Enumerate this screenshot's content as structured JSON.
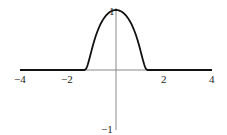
{
  "chart_data": {
    "type": "line",
    "title": "",
    "xlabel": "",
    "ylabel": "",
    "xlim": [
      -4,
      4
    ],
    "ylim": [
      -1,
      1
    ],
    "grid": false,
    "legend": null,
    "x_ticks": [
      {
        "value": -4,
        "label": "−4"
      },
      {
        "value": -2,
        "label": "−2"
      },
      {
        "value": 2,
        "label": "2"
      },
      {
        "value": 4,
        "label": "4"
      }
    ],
    "y_ticks": [
      {
        "value": 1,
        "label": "1"
      },
      {
        "value": -1,
        "label": "−1"
      }
    ],
    "series": [
      {
        "name": "bump function",
        "description": "smooth compactly supported bump, zero for |x| >= ~1.4, peak 1 at x=0",
        "x": [
          -4,
          -2,
          -1.4,
          -1.2,
          -1.0,
          -0.8,
          -0.6,
          -0.4,
          -0.2,
          0,
          0.2,
          0.4,
          0.6,
          0.8,
          1.0,
          1.2,
          1.4,
          2,
          4
        ],
        "y": [
          0,
          0,
          0,
          0.03,
          0.15,
          0.35,
          0.58,
          0.8,
          0.95,
          1,
          0.95,
          0.8,
          0.58,
          0.35,
          0.15,
          0.03,
          0,
          0,
          0
        ]
      }
    ]
  }
}
